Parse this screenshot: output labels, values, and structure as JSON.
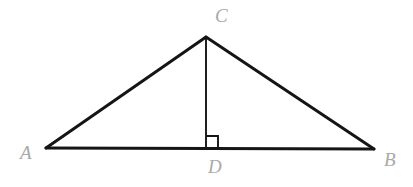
{
  "figure": {
    "background_color": "#ffffff",
    "stroke_color": "#151515",
    "label_color": "#a9a9a9",
    "width": 413,
    "height": 187
  },
  "labels": {
    "a": "A",
    "b": "B",
    "c": "C",
    "d": "D"
  },
  "points": {
    "A": {
      "x": 46,
      "y": 148
    },
    "B": {
      "x": 374,
      "y": 149
    },
    "C": {
      "x": 206,
      "y": 37
    },
    "D": {
      "x": 206,
      "y": 148
    }
  },
  "segments": [
    {
      "name": "side-AC",
      "from": "A",
      "to": "C",
      "stroke_width": 3.0
    },
    {
      "name": "side-CB",
      "from": "C",
      "to": "B",
      "stroke_width": 3.0
    },
    {
      "name": "side-AB",
      "from": "A",
      "to": "B",
      "stroke_width": 3.0
    },
    {
      "name": "altitude-CD",
      "from": "C",
      "to": "D",
      "stroke_width": 1.9
    }
  ],
  "right_angle_marker": {
    "name": "right-angle-at-D",
    "at_point": "D",
    "size": 12,
    "stroke_width": 1.9,
    "opens_toward": "B"
  }
}
